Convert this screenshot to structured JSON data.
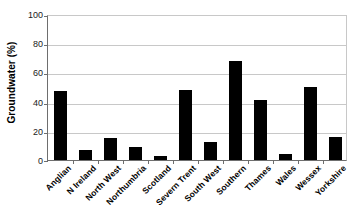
{
  "chart_data": {
    "type": "bar",
    "title": "",
    "subtitle": "",
    "xlabel": "",
    "ylabel": "Groundwater (%)",
    "categories": [
      "Anglian",
      "N Ireland",
      "North West",
      "Northumbria",
      "Scotland",
      "Severn Trent",
      "South West",
      "Southern",
      "Thames",
      "Wales",
      "Wessex",
      "Yorkshire"
    ],
    "values": [
      47,
      7,
      15,
      9,
      3,
      48,
      12,
      68,
      41,
      4,
      50,
      16
    ],
    "ylim": [
      0,
      100
    ],
    "ytick_values": [
      0,
      20,
      40,
      60,
      80,
      100
    ],
    "ytick_labels": [
      "0",
      "20",
      "40",
      "60",
      "80",
      "100"
    ],
    "grid": true,
    "grid_axis": "y",
    "legend": false,
    "legend_position": "none",
    "bar_color": "#000000",
    "gridline_color": "#c8c8c8",
    "axis_color": "#6e6e6e",
    "background_color": "#ffffff",
    "xtick_label_rotation": -45
  }
}
